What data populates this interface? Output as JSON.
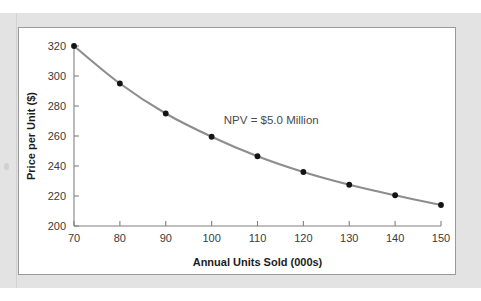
{
  "chart_data": {
    "type": "line",
    "title": "",
    "subtitle": "",
    "xlabel": "Annual Units Sold (000s)",
    "ylabel": "Price per Unit ($)",
    "x": [
      70,
      80,
      90,
      100,
      110,
      120,
      130,
      140,
      150
    ],
    "values": [
      320,
      295,
      275,
      259.5,
      246.5,
      236,
      227.5,
      220.5,
      214
    ],
    "series": [
      {
        "name": "NPV = $5.0 Million",
        "values": [
          320,
          295,
          275,
          259.5,
          246.5,
          236,
          227.5,
          220.5,
          214
        ]
      }
    ],
    "xlim": [
      70,
      150
    ],
    "ylim": [
      200,
      320
    ],
    "xticks": [
      70,
      80,
      90,
      100,
      110,
      120,
      130,
      140,
      150
    ],
    "yticks": [
      200,
      220,
      240,
      260,
      280,
      300,
      320
    ],
    "xtick_labels": [
      "70",
      "80",
      "90",
      "100",
      "110",
      "120",
      "130",
      "140",
      "150"
    ],
    "ytick_labels": [
      "200",
      "220",
      "240",
      "260",
      "280",
      "300",
      "320"
    ],
    "grid": false,
    "legend": false,
    "legend_position": "none",
    "annotations": [
      {
        "text": "NPV = $5.0 Million",
        "x": 113,
        "y": 268
      }
    ],
    "markers": "filled-circle",
    "colors": {
      "curve": "#8d8d8d",
      "marker": "#141414",
      "axis": "#808080",
      "tick_label": "#3a3a3a",
      "axis_title": "#1c1c1c",
      "panel_background": "#ffffff",
      "panel_border": "#9a9a9a",
      "page_backdrop": "#e3e3e3"
    }
  }
}
